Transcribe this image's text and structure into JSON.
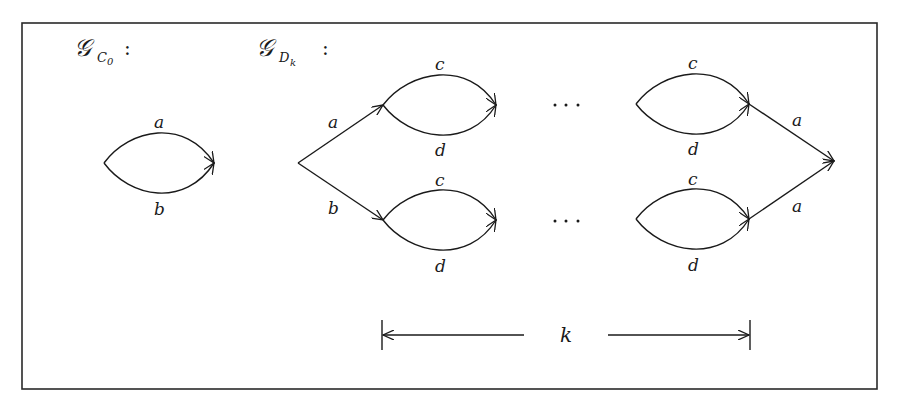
{
  "figure": {
    "colors": {
      "stroke": "#1a1a1a",
      "frame": "#2a2a2a",
      "background": "#ffffff"
    },
    "graph_c0": {
      "title_symbol": "𝒢",
      "title_subscript": "C",
      "title_subsubscript": "0",
      "title_colon": ":",
      "edges": [
        {
          "label": "a",
          "from": "u",
          "to": "v",
          "shape": "upper-arc"
        },
        {
          "label": "b",
          "from": "u",
          "to": "v",
          "shape": "lower-arc"
        }
      ]
    },
    "graph_dk": {
      "title_symbol": "𝒢",
      "title_subscript": "D",
      "title_subsubscript": "k",
      "title_colon": ":",
      "branch_labels": {
        "upper_in": "a",
        "lower_in": "b",
        "upper_out": "a",
        "lower_out": "a"
      },
      "lens_labels": {
        "upper_first_top": "c",
        "upper_first_bottom": "d",
        "lower_first_top": "c",
        "lower_first_bottom": "d",
        "upper_last_top": "c",
        "upper_last_bottom": "d",
        "lower_last_top": "c",
        "lower_last_bottom": "d"
      },
      "ellipsis": "…",
      "span_label": "k"
    }
  }
}
